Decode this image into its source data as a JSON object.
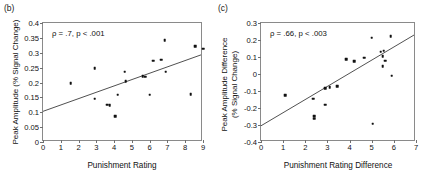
{
  "figure": {
    "panels": [
      {
        "tag": "(b)",
        "annotation": "ρ = .7, p < .001",
        "chart_index": 0
      },
      {
        "tag": "(c)",
        "annotation": "ρ = .66, p < .003",
        "chart_index": 1
      }
    ]
  },
  "chart_data": [
    {
      "type": "scatter",
      "title": "",
      "panel_label": "(b)",
      "xlabel": "Punishment Rating",
      "ylabel": "Peak Amplitude (% Signal Change)",
      "ylabel_lines": [
        "Peak Amplitude (% Signal Change)"
      ],
      "xlim": [
        0,
        9
      ],
      "ylim": [
        0,
        0.4
      ],
      "xticks": [
        0,
        1,
        2,
        3,
        4,
        5,
        6,
        7,
        8,
        9
      ],
      "xticklabels": [
        "0",
        "1",
        "2",
        "3",
        "4",
        "5",
        "6",
        "7",
        "8",
        "9"
      ],
      "yticks": [
        0,
        0.05,
        0.1,
        0.15,
        0.2,
        0.25,
        0.3,
        0.35,
        0.4
      ],
      "yticklabels": [
        "0",
        "0.05",
        "0.1",
        "0.15",
        "0.2",
        "0.25",
        "0.3",
        "0.35",
        "0.4"
      ],
      "grid": false,
      "legend": null,
      "annotation": "ρ = .7, p < .001",
      "stats": {
        "rho": 0.7,
        "p_text": "p < .001"
      },
      "points": [
        {
          "x": 1.55,
          "y": 0.197
        },
        {
          "x": 2.9,
          "y": 0.249
        },
        {
          "x": 2.9,
          "y": 0.146
        },
        {
          "x": 3.6,
          "y": 0.126
        },
        {
          "x": 3.75,
          "y": 0.123
        },
        {
          "x": 4.05,
          "y": 0.086
        },
        {
          "x": 4.2,
          "y": 0.159
        },
        {
          "x": 4.6,
          "y": 0.236
        },
        {
          "x": 4.65,
          "y": 0.204
        },
        {
          "x": 5.6,
          "y": 0.221
        },
        {
          "x": 5.75,
          "y": 0.219
        },
        {
          "x": 6.0,
          "y": 0.159
        },
        {
          "x": 6.2,
          "y": 0.273
        },
        {
          "x": 6.65,
          "y": 0.277
        },
        {
          "x": 6.85,
          "y": 0.343
        },
        {
          "x": 6.9,
          "y": 0.236
        },
        {
          "x": 8.3,
          "y": 0.16
        },
        {
          "x": 8.55,
          "y": 0.323
        },
        {
          "x": 9.0,
          "y": 0.313
        }
      ],
      "fit_line": {
        "x0": 0,
        "y0": 0.098,
        "x1": 9,
        "y1": 0.291
      }
    },
    {
      "type": "scatter",
      "title": "",
      "panel_label": "(c)",
      "xlabel": "Punishment Rating Difference",
      "ylabel": "Peak Amplitude Difference (% Signal Change)",
      "ylabel_lines": [
        "Peak Amplitude Difference",
        "(% Signal Change)"
      ],
      "xlim": [
        0,
        7
      ],
      "ylim": [
        -0.4,
        0.3
      ],
      "xticks": [
        0,
        1,
        2,
        3,
        4,
        5,
        6,
        7
      ],
      "xticklabels": [
        "0",
        "1",
        "2",
        "3",
        "4",
        "5",
        "6",
        "7"
      ],
      "yticks": [
        -0.4,
        -0.3,
        -0.2,
        -0.1,
        0,
        0.1,
        0.2,
        0.3
      ],
      "yticklabels": [
        "-0.4",
        "-0.3",
        "-0.2",
        "-0.1",
        "0",
        "0.1",
        "0.2",
        "0.3"
      ],
      "grid": false,
      "legend": null,
      "annotation": "ρ = .66, p < .003",
      "stats": {
        "rho": 0.66,
        "p_text": "p < .003"
      },
      "points": [
        {
          "x": 1.1,
          "y": -0.124
        },
        {
          "x": 2.35,
          "y": -0.146
        },
        {
          "x": 2.4,
          "y": -0.247
        },
        {
          "x": 2.4,
          "y": -0.262
        },
        {
          "x": 2.9,
          "y": -0.083
        },
        {
          "x": 2.9,
          "y": -0.181
        },
        {
          "x": 3.1,
          "y": -0.079
        },
        {
          "x": 3.45,
          "y": -0.071
        },
        {
          "x": 3.85,
          "y": 0.088
        },
        {
          "x": 4.2,
          "y": 0.077
        },
        {
          "x": 4.65,
          "y": 0.096
        },
        {
          "x": 5.0,
          "y": 0.213
        },
        {
          "x": 5.05,
          "y": -0.292
        },
        {
          "x": 5.4,
          "y": 0.131
        },
        {
          "x": 5.5,
          "y": 0.104
        },
        {
          "x": 5.5,
          "y": 0.045
        },
        {
          "x": 5.55,
          "y": 0.138
        },
        {
          "x": 5.6,
          "y": 0.078
        },
        {
          "x": 5.85,
          "y": 0.222
        },
        {
          "x": 5.9,
          "y": -0.009
        }
      ],
      "fit_line": {
        "x0": 0,
        "y0": -0.315,
        "x1": 7,
        "y1": 0.228
      }
    }
  ]
}
